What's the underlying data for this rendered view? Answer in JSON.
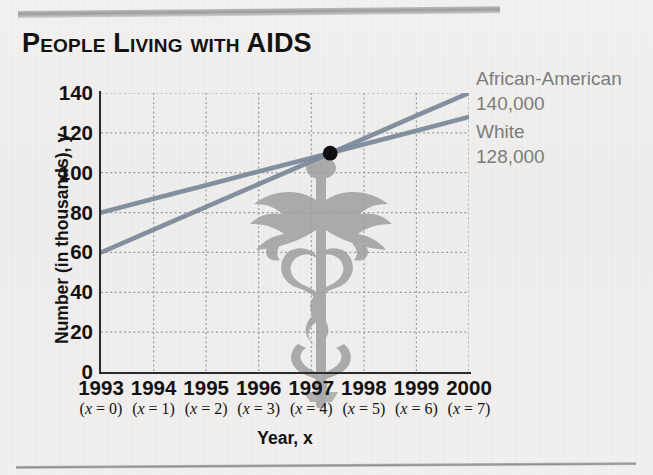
{
  "title": "People Living with AIDS",
  "axis": {
    "x_title": "Year, x",
    "y_title": "Number (in thousands), y"
  },
  "legend": [
    {
      "name": "African-American",
      "value": "140,000"
    },
    {
      "name": "White",
      "value": "128,000"
    }
  ],
  "chart_data": {
    "type": "line",
    "title": "People Living with AIDS",
    "xlabel": "Year, x",
    "ylabel": "Number (in thousands), y",
    "grid": true,
    "legend_position": "right",
    "xlim": [
      0,
      7
    ],
    "ylim": [
      0,
      140
    ],
    "ytick_values": [
      0,
      20,
      40,
      60,
      80,
      100,
      120,
      140
    ],
    "ytick_labels": [
      "0",
      "20",
      "40",
      "60",
      "80",
      "100",
      "120",
      "140"
    ],
    "xtick_values": [
      0,
      1,
      2,
      3,
      4,
      5,
      6,
      7
    ],
    "xtick_labels": [
      "1993",
      "1994",
      "1995",
      "1996",
      "1997",
      "1998",
      "1999",
      "2000"
    ],
    "xtick_sublabels": [
      "(x = 0)",
      "(x = 1)",
      "(x = 2)",
      "(x = 3)",
      "(x = 4)",
      "(x = 5)",
      "(x = 6)",
      "(x = 7)"
    ],
    "x": [
      0,
      1,
      2,
      3,
      4,
      5,
      6,
      7
    ],
    "series": [
      {
        "name": "African-American",
        "color": "#7b8a9b",
        "end_label": "140,000",
        "values": [
          60,
          71.4,
          82.9,
          94.3,
          105.7,
          117.1,
          128.6,
          140
        ]
      },
      {
        "name": "White",
        "color": "#7b8a9b",
        "end_label": "128,000",
        "values": [
          80,
          86.9,
          93.7,
          100.6,
          107.4,
          114.3,
          121.1,
          128
        ]
      }
    ],
    "annotations": [
      {
        "type": "point",
        "label": "intersection",
        "x": 4.36,
        "y": 109.8,
        "color": "#111111"
      }
    ]
  },
  "ticks": {
    "y": [
      "140",
      "120",
      "100",
      "80",
      "60",
      "40",
      "20",
      "0"
    ],
    "x_years": [
      "1993",
      "1994",
      "1995",
      "1996",
      "1997",
      "1998",
      "1999",
      "2000"
    ],
    "x_vars": [
      "(x = 0)",
      "(x = 1)",
      "(x = 2)",
      "(x = 3)",
      "(x = 4)",
      "(x = 5)",
      "(x = 6)",
      "(x = 7)"
    ]
  }
}
